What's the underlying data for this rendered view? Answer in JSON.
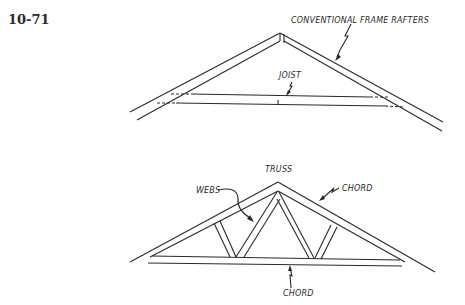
{
  "figure": {
    "number": "10-71",
    "top_diagram": {
      "title": "Conventional frame roof",
      "labels": {
        "rafters": "CONVENTIONAL FRAME RAFTERS",
        "joist": "JOIST"
      }
    },
    "bottom_diagram": {
      "title": "Truss roof",
      "labels": {
        "truss": "TRUSS",
        "webs": "WEBS",
        "top_chord": "CHORD",
        "bottom_chord": "CHORD"
      }
    }
  }
}
